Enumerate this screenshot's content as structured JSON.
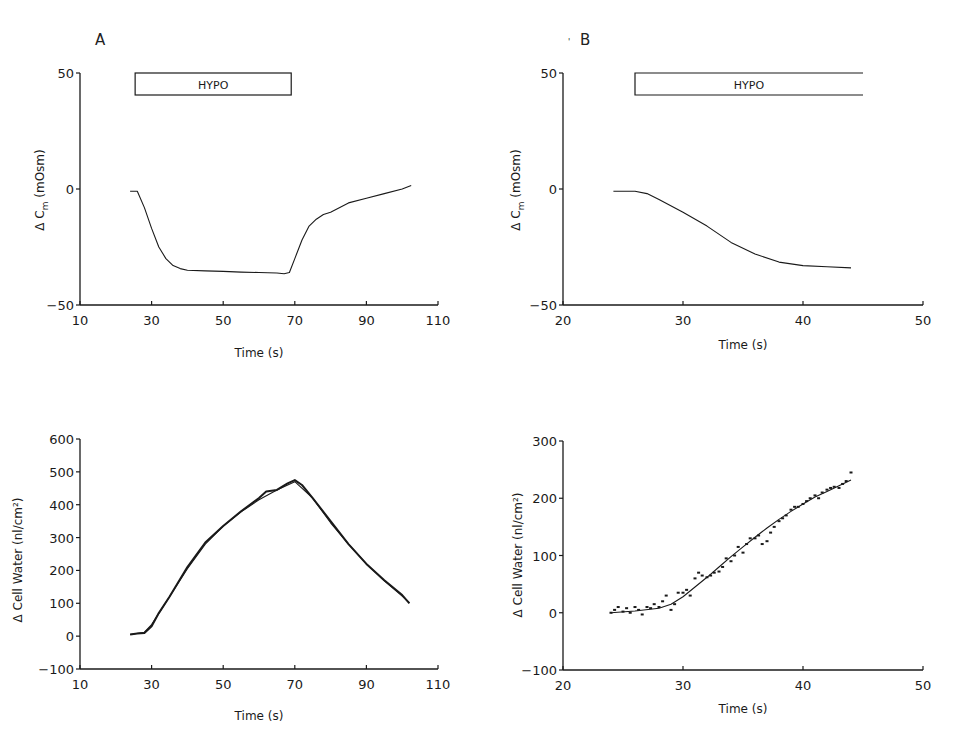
{
  "figure": {
    "panels": [
      {
        "letter": "A"
      },
      {
        "letter": "B"
      }
    ]
  },
  "chart_data": [
    {
      "id": "A-top",
      "type": "line",
      "panel": "A",
      "title": "",
      "xlabel": "Time (s)",
      "ylabel": "Δ C_m (mOsm)",
      "xlim": [
        10,
        110
      ],
      "ylim": [
        -50,
        50
      ],
      "xticks": [
        10,
        30,
        50,
        70,
        90,
        110
      ],
      "yticks": [
        -50,
        0,
        50
      ],
      "grid": false,
      "annotation": {
        "label": "HYPO",
        "x_start": 25.4,
        "x_end": 69,
        "open_right": false
      },
      "series": [
        {
          "name": "ΔCm",
          "x": [
            24,
            26,
            28,
            30,
            32,
            34,
            36,
            38,
            40,
            45,
            50,
            55,
            60,
            65,
            67,
            68.5,
            70,
            72,
            74,
            76,
            78,
            80,
            85,
            90,
            95,
            100,
            102.5
          ],
          "y": [
            -1,
            -1,
            -8,
            -17,
            -25,
            -30,
            -33,
            -34.3,
            -35,
            -35.3,
            -35.5,
            -35.8,
            -36,
            -36.2,
            -36.5,
            -36,
            -30,
            -22,
            -16,
            -13,
            -11,
            -10,
            -6,
            -4,
            -2,
            0,
            1.5
          ]
        }
      ]
    },
    {
      "id": "B-top",
      "type": "line",
      "panel": "B",
      "title": "",
      "xlabel": "Time (s)",
      "ylabel": "Δ C_m (mOsm)",
      "xlim": [
        20,
        50
      ],
      "ylim": [
        -50,
        50
      ],
      "xticks": [
        20,
        30,
        40,
        50
      ],
      "yticks": [
        -50,
        0,
        50
      ],
      "grid": false,
      "annotation": {
        "label": "HYPO",
        "x_start": 26,
        "x_end": 45,
        "open_right": true
      },
      "series": [
        {
          "name": "ΔCm",
          "x": [
            24.2,
            26,
            27,
            28,
            30,
            32,
            34,
            36,
            38,
            40,
            42,
            44
          ],
          "y": [
            -1,
            -1,
            -2,
            -4.5,
            -10,
            -16,
            -23,
            -28,
            -31.5,
            -33,
            -33.5,
            -34
          ]
        }
      ]
    },
    {
      "id": "A-bottom",
      "type": "line",
      "panel": "A",
      "title": "",
      "xlabel": "Time (s)",
      "ylabel": "Δ Cell Water (nl/cm²)",
      "xlim": [
        10,
        110
      ],
      "ylim": [
        -100,
        600
      ],
      "xticks": [
        10,
        30,
        50,
        70,
        90,
        110
      ],
      "yticks": [
        -100,
        0,
        100,
        200,
        300,
        400,
        500,
        600
      ],
      "grid": false,
      "series": [
        {
          "name": "measured",
          "x": [
            24,
            26,
            28,
            30,
            32,
            35,
            40,
            45,
            50,
            55,
            60,
            62,
            65,
            68,
            70,
            72,
            75,
            80,
            85,
            90,
            95,
            100,
            102
          ],
          "y": [
            5,
            8,
            10,
            30,
            70,
            120,
            210,
            285,
            335,
            380,
            420,
            440,
            445,
            465,
            475,
            460,
            420,
            350,
            280,
            220,
            170,
            125,
            100
          ]
        },
        {
          "name": "fit",
          "x": [
            24,
            28,
            30,
            35,
            40,
            45,
            50,
            55,
            60,
            65,
            70,
            75,
            80,
            85,
            90,
            95,
            100,
            102
          ],
          "y": [
            5,
            12,
            35,
            120,
            205,
            280,
            335,
            378,
            415,
            445,
            470,
            420,
            345,
            280,
            220,
            168,
            122,
            102
          ]
        }
      ]
    },
    {
      "id": "B-bottom",
      "type": "scatter",
      "panel": "B",
      "title": "",
      "xlabel": "Time (s)",
      "ylabel": "Δ Cell Water (nl/cm²)",
      "xlim": [
        20,
        50
      ],
      "ylim": [
        -100,
        300
      ],
      "xticks": [
        20,
        30,
        40,
        50
      ],
      "yticks": [
        -100,
        0,
        100,
        200,
        300
      ],
      "grid": false,
      "series": [
        {
          "name": "measured",
          "x": [
            24,
            24.3,
            24.6,
            25,
            25.3,
            25.6,
            26,
            26.3,
            26.6,
            27,
            27.3,
            27.6,
            28,
            28.3,
            28.6,
            29,
            29.3,
            29.6,
            30,
            30.3,
            30.6,
            31,
            31.3,
            31.6,
            32,
            32.3,
            32.6,
            33,
            33.3,
            33.6,
            34,
            34.3,
            34.6,
            35,
            35.3,
            35.6,
            36,
            36.3,
            36.6,
            37,
            37.3,
            37.6,
            38,
            38.3,
            38.6,
            39,
            39.3,
            39.6,
            40,
            40.3,
            40.6,
            41,
            41.3,
            41.6,
            42,
            42.3,
            42.6,
            43,
            43.3,
            43.6,
            44
          ],
          "y": [
            0,
            5,
            10,
            2,
            8,
            0,
            10,
            5,
            -3,
            10,
            8,
            15,
            10,
            20,
            30,
            5,
            15,
            35,
            35,
            40,
            30,
            60,
            70,
            65,
            62,
            65,
            70,
            72,
            80,
            95,
            90,
            100,
            115,
            105,
            120,
            130,
            130,
            135,
            120,
            125,
            140,
            150,
            160,
            165,
            170,
            180,
            185,
            185,
            190,
            195,
            200,
            205,
            200,
            210,
            215,
            218,
            220,
            218,
            225,
            230,
            245
          ]
        },
        {
          "name": "fit",
          "x": [
            24,
            26,
            28,
            29,
            30,
            31,
            32,
            33,
            34,
            35,
            36,
            37,
            38,
            39,
            40,
            41,
            42,
            43,
            44
          ],
          "y": [
            0,
            3,
            8,
            15,
            28,
            45,
            62,
            80,
            98,
            115,
            132,
            148,
            163,
            177,
            190,
            202,
            212,
            222,
            232
          ]
        }
      ]
    }
  ],
  "styles": {
    "ink": "#1a1a1a",
    "background": "#ffffff"
  }
}
